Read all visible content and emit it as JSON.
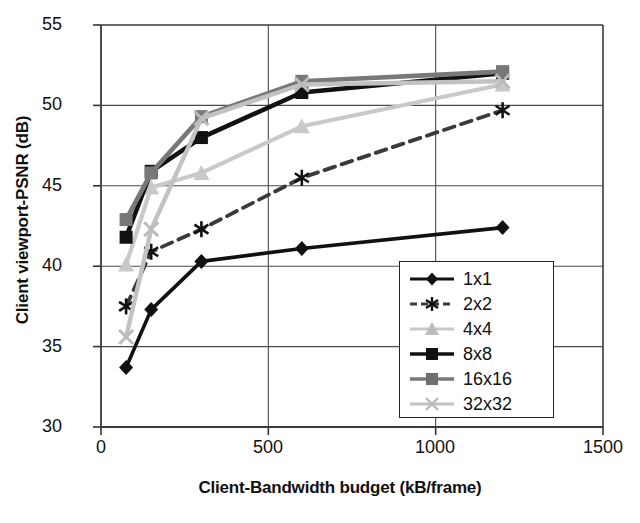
{
  "chart_data": {
    "type": "line",
    "title": "",
    "xlabel": "Client-Bandwidth budget (kB/frame)",
    "ylabel": "Client viewport-PSNR (dB)",
    "xlim": [
      0,
      1500
    ],
    "ylim": [
      30,
      55
    ],
    "xticks": [
      0,
      500,
      1000,
      1500
    ],
    "yticks": [
      30,
      35,
      40,
      45,
      50,
      55
    ],
    "grid": true,
    "legend_position": "lower-right-inside",
    "x": [
      75,
      150,
      300,
      600,
      1200
    ],
    "series": [
      {
        "name": "1x1",
        "marker": "diamond",
        "linestyle": "solid",
        "color": "#111111",
        "values": [
          33.7,
          37.3,
          40.3,
          41.1,
          42.4
        ]
      },
      {
        "name": "2x2",
        "marker": "asterisk",
        "linestyle": "dashed",
        "color": "#3a3a3a",
        "values": [
          37.5,
          40.9,
          42.3,
          45.5,
          49.7
        ]
      },
      {
        "name": "4x4",
        "marker": "triangle",
        "linestyle": "solid",
        "color": "#c9c9c9",
        "values": [
          40.1,
          44.9,
          45.8,
          48.7,
          51.3
        ]
      },
      {
        "name": "8x8",
        "marker": "square",
        "linestyle": "solid",
        "color": "#111111",
        "values": [
          41.8,
          45.9,
          48.0,
          50.8,
          52.0
        ]
      },
      {
        "name": "16x16",
        "marker": "square",
        "linestyle": "solid",
        "color": "#787878",
        "values": [
          42.9,
          45.8,
          49.3,
          51.5,
          52.1
        ]
      },
      {
        "name": "32x32",
        "marker": "cross",
        "linestyle": "solid",
        "color": "#c2c2c2",
        "values": [
          35.6,
          42.3,
          49.2,
          51.3,
          51.5
        ]
      }
    ]
  },
  "axes": {
    "ylabel": "Client viewport-PSNR (dB)",
    "xlabel": "Client-Bandwidth budget (kB/frame)",
    "ytick_labels": [
      "55",
      "50",
      "45",
      "40",
      "35",
      "30"
    ],
    "xtick_labels": [
      "0",
      "500",
      "1000",
      "1500"
    ]
  },
  "legend": {
    "items": [
      {
        "label": "1x1"
      },
      {
        "label": "2x2"
      },
      {
        "label": "4x4"
      },
      {
        "label": "8x8"
      },
      {
        "label": "16x16"
      },
      {
        "label": "32x32"
      }
    ]
  }
}
